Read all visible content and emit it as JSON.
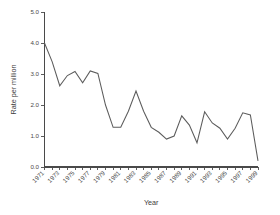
{
  "chart_data": {
    "type": "line",
    "title": "",
    "xlabel": "Year",
    "ylabel": "Rate per million",
    "xlim": [
      1971,
      1999
    ],
    "ylim": [
      0.0,
      5.0
    ],
    "grid": false,
    "legend": "none",
    "y_ticks": [
      "0.0",
      "1.0",
      "2.0",
      "3.0",
      "4.0",
      "5.0"
    ],
    "y_tick_values": [
      0.0,
      1.0,
      2.0,
      3.0,
      4.0,
      5.0
    ],
    "x_tick_labels": [
      "1971",
      "1973",
      "1975",
      "1977",
      "1979",
      "1981",
      "1983",
      "1985",
      "1987",
      "1989",
      "1991",
      "1993",
      "1995",
      "1997",
      "1999"
    ],
    "x": [
      1971,
      1972,
      1973,
      1974,
      1975,
      1976,
      1977,
      1978,
      1979,
      1980,
      1981,
      1982,
      1983,
      1984,
      1985,
      1986,
      1987,
      1988,
      1989,
      1990,
      1991,
      1992,
      1993,
      1994,
      1995,
      1996,
      1997,
      1998,
      1999
    ],
    "values": [
      4.0,
      3.4,
      2.62,
      2.95,
      3.08,
      2.72,
      3.1,
      3.02,
      2.0,
      1.28,
      1.28,
      1.8,
      2.45,
      1.8,
      1.28,
      1.12,
      0.9,
      1.0,
      1.65,
      1.35,
      0.78,
      1.78,
      1.42,
      1.25,
      0.9,
      1.25,
      1.75,
      1.68,
      0.2
    ],
    "series_color": "#5c5c5c",
    "background_color": "#ffffff"
  }
}
